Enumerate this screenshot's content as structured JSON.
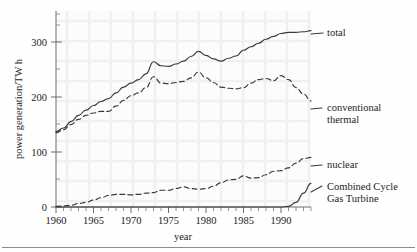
{
  "chart_data": {
    "type": "line",
    "title": "",
    "xlabel": "year",
    "ylabel": "power generation/TW h",
    "xlim": [
      1960,
      1994
    ],
    "ylim": [
      0,
      340
    ],
    "xticks": [
      1960,
      1965,
      1970,
      1975,
      1980,
      1985,
      1990
    ],
    "yticks": [
      0,
      100,
      200,
      300
    ],
    "grid": true,
    "grid_style": "faint background texture",
    "legend_position": "inline labels at right of each curve",
    "x": [
      1960,
      1961,
      1962,
      1963,
      1964,
      1965,
      1966,
      1967,
      1968,
      1969,
      1970,
      1971,
      1972,
      1973,
      1974,
      1975,
      1976,
      1977,
      1978,
      1979,
      1980,
      1981,
      1982,
      1983,
      1984,
      1985,
      1986,
      1987,
      1988,
      1989,
      1990,
      1991,
      1992,
      1993,
      1994
    ],
    "series": [
      {
        "name": "total",
        "label": "total",
        "line_style": "solid",
        "values": [
          131,
          137,
          148,
          159,
          168,
          176,
          183,
          188,
          198,
          208,
          215,
          221,
          231,
          252,
          245,
          244,
          248,
          253,
          261,
          270,
          263,
          257,
          253,
          258,
          262,
          272,
          278,
          284,
          291,
          296,
          301,
          303,
          303,
          304,
          306
        ]
      },
      {
        "name": "conventional-thermal",
        "label": "conventional thermal",
        "line_style": "dashed",
        "values": [
          129,
          134,
          143,
          152,
          159,
          163,
          166,
          166,
          175,
          185,
          193,
          198,
          207,
          226,
          215,
          214,
          216,
          218,
          224,
          234,
          224,
          216,
          208,
          206,
          205,
          207,
          215,
          221,
          223,
          219,
          228,
          221,
          207,
          196,
          184
        ]
      },
      {
        "name": "nuclear",
        "label": "nuclear",
        "line_style": "dashed",
        "values": [
          1,
          2,
          3,
          6,
          8,
          12,
          16,
          20,
          22,
          22,
          21,
          22,
          24,
          25,
          29,
          29,
          32,
          35,
          32,
          31,
          32,
          36,
          42,
          47,
          48,
          54,
          50,
          51,
          56,
          62,
          63,
          68,
          76,
          84,
          86
        ]
      },
      {
        "name": "combined-cycle-gas-turbine",
        "label": "Combined Cycle Gas Turbine",
        "line_style": "solid",
        "values": [
          0,
          0,
          0,
          0,
          0,
          0,
          0,
          0,
          0,
          0,
          0,
          0,
          0,
          0,
          0,
          0,
          0,
          0,
          0,
          0,
          0,
          0,
          0,
          0,
          0,
          0,
          0,
          0,
          0,
          0,
          0,
          1,
          8,
          24,
          41
        ]
      }
    ],
    "annotations": [
      {
        "text": "total",
        "for": "total"
      },
      {
        "text": "conventional",
        "for": "conventional-thermal"
      },
      {
        "text": "thermal",
        "for": "conventional-thermal"
      },
      {
        "text": "nuclear",
        "for": "nuclear"
      },
      {
        "text": "Combined Cycle",
        "for": "combined-cycle-gas-turbine"
      },
      {
        "text": "Gas Turbine",
        "for": "combined-cycle-gas-turbine"
      }
    ]
  },
  "axes": {
    "x_label": "year",
    "y_label": "power generation/TW h",
    "x_tick_labels": [
      "1960",
      "1965",
      "1970",
      "1975",
      "1980",
      "1985",
      "1990"
    ],
    "y_tick_labels": [
      "0",
      "100",
      "200",
      "300"
    ]
  },
  "labels": {
    "total": "total",
    "conventional_line1": "conventional",
    "conventional_line2": "thermal",
    "nuclear": "nuclear",
    "ccgt_line1": "Combined Cycle",
    "ccgt_line2": "Gas Turbine"
  },
  "colors": {
    "ink": "#3a3a3a",
    "axis": "#6d6d6d",
    "background": "#fefefe",
    "grid": "#f0f0f0"
  }
}
